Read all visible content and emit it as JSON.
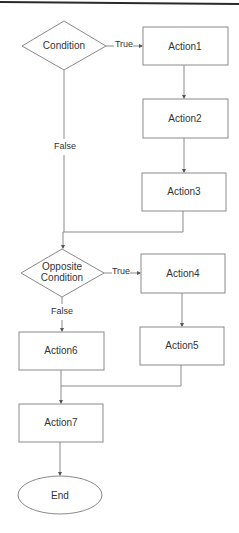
{
  "diagram": {
    "type": "flowchart",
    "colors": {
      "stroke": "#8a8a8a",
      "text": "#333333",
      "background": "#ffffff",
      "top_rule": "#2a2a2a"
    },
    "nodes": {
      "condition": {
        "label": "Condition",
        "shape": "diamond"
      },
      "action1": {
        "label": "Action1",
        "shape": "rect"
      },
      "action2": {
        "label": "Action2",
        "shape": "rect"
      },
      "action3": {
        "label": "Action3",
        "shape": "rect"
      },
      "opposite_condition": {
        "line1": "Opposite",
        "line2": "Condition",
        "shape": "diamond"
      },
      "action4": {
        "label": "Action4",
        "shape": "rect"
      },
      "action5": {
        "label": "Action5",
        "shape": "rect"
      },
      "action6": {
        "label": "Action6",
        "shape": "rect"
      },
      "action7": {
        "label": "Action7",
        "shape": "rect"
      },
      "end": {
        "label": "End",
        "shape": "ellipse"
      }
    },
    "edges": {
      "condition_true": "True",
      "condition_false": "False",
      "opposite_true": "True",
      "opposite_false": "False"
    }
  }
}
